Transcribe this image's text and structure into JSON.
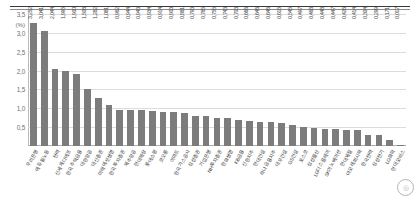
{
  "chart_data": {
    "type": "bar",
    "title": "",
    "subtitle": "",
    "xlabel": "",
    "ylabel": "",
    "yunit": "(%)",
    "ylim": [
      0,
      3.5
    ],
    "yticks": [
      "0,5",
      "1,0",
      "1,5",
      "2,0",
      "2,5",
      "3,0",
      "3,5"
    ],
    "ytick_values": [
      0.5,
      1.0,
      1.5,
      2.0,
      2.5,
      3.0,
      3.5
    ],
    "grid": true,
    "legend": null,
    "bar_color": "#7c7c7c",
    "categories": [
      "우리은행",
      "에듀윌노동",
      "전력",
      "신세계디에프",
      "한국주택금융",
      "대한항공",
      "대신증권",
      "미래에셋생명",
      "한국투자증권",
      "제주항공",
      "현대해상",
      "롯데쇼핑",
      "코오롱",
      "이마트",
      "한국가스공사",
      "삼성증권",
      "기업은행",
      "NH투자증권",
      "한화생명",
      "KB금융",
      "신한지주",
      "현대건설",
      "하나금융지주",
      "대우건설",
      "GS건설",
      "포스코",
      "삼성물산",
      "LG디스플레이",
      "SK이노베이션",
      "현대제철",
      "아모레퍼시픽",
      "한국전력",
      "삼성전기",
      "LG화학",
      "현대모비스"
    ],
    "values": [
      3.252,
      3.041,
      2.044,
      1.995,
      1.9,
      1.508,
      1.282,
      1.081,
      0.962,
      0.944,
      0.943,
      0.934,
      0.914,
      0.903,
      0.881,
      0.793,
      0.785,
      0.755,
      0.743,
      0.703,
      0.666,
      0.646,
      0.646,
      0.615,
      0.545,
      0.497,
      0.468,
      0.448,
      0.447,
      0.426,
      0.414,
      0.304,
      0.299,
      0.171,
      0.017
    ],
    "value_labels": [
      "3,252",
      "3,041",
      "2,044",
      "1,995",
      "1,900",
      "1,508",
      "1,282",
      "1,081",
      "0,962",
      "0,944",
      "0,943",
      "0,934",
      "0,914",
      "0,903",
      "0,881",
      "0,793",
      "0,785",
      "0,755",
      "0,743",
      "0,703",
      "0,666",
      "0,646",
      "0,646",
      "0,615",
      "0,545",
      "0,497",
      "0,468",
      "0,448",
      "0,447",
      "0,426",
      "0,414",
      "0,304",
      "0,299",
      "0,171",
      "0,017"
    ]
  },
  "watermark": {
    "glyph": "◎"
  }
}
